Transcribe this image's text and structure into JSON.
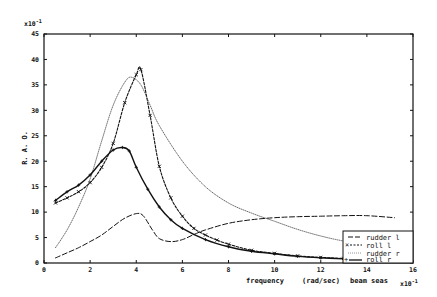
{
  "chart_data": {
    "type": "line",
    "title": "",
    "xlabel": "frequency   (rad/sec)   beam seas",
    "ylabel": "R. A. O.",
    "x_multiplier": "x10^-1",
    "y_multiplier": "x10^-1",
    "xlim": [
      0,
      16
    ],
    "ylim": [
      0,
      45
    ],
    "xticks": [
      0,
      2,
      4,
      6,
      8,
      10,
      12,
      14,
      16
    ],
    "yticks": [
      0,
      5,
      10,
      15,
      20,
      25,
      30,
      35,
      40,
      45
    ],
    "grid": false,
    "legend_position": "lower right",
    "series": [
      {
        "name": "rudder l",
        "style": "long-dash",
        "x": [
          0.5,
          1,
          1.5,
          2,
          2.5,
          3,
          3.5,
          4,
          4.3,
          4.7,
          5,
          5.5,
          6,
          6.5,
          7,
          8,
          9,
          10,
          11,
          12,
          13,
          14,
          15.2
        ],
        "y": [
          1.0,
          2.0,
          3.0,
          4.2,
          5.5,
          7.2,
          8.8,
          9.7,
          9.3,
          6.5,
          4.8,
          4.2,
          4.6,
          5.6,
          6.5,
          7.8,
          8.5,
          8.9,
          9.1,
          9.2,
          9.3,
          9.3,
          8.9
        ]
      },
      {
        "name": "roll l",
        "style": "short-dash with x markers",
        "x": [
          0.5,
          1,
          1.5,
          2,
          2.5,
          3,
          3.5,
          4,
          4.2,
          4.6,
          5,
          5.5,
          6,
          6.5,
          7,
          7.5,
          8,
          9,
          10,
          11,
          12,
          13
        ],
        "y": [
          11.8,
          12.8,
          14.0,
          15.8,
          18.8,
          23.5,
          31.5,
          37.0,
          38.0,
          29.0,
          19.0,
          12.8,
          9.2,
          6.8,
          5.5,
          4.5,
          3.7,
          2.5,
          1.9,
          1.4,
          1.1,
          0.9
        ]
      },
      {
        "name": "rudder r",
        "style": "dotted",
        "x": [
          0.5,
          1,
          1.5,
          2,
          2.5,
          3,
          3.5,
          3.8,
          4.2,
          4.6,
          5,
          6,
          7,
          8,
          9,
          10,
          11,
          12,
          13,
          14
        ],
        "y": [
          3.0,
          6.5,
          11.0,
          16.5,
          24.0,
          31.0,
          35.5,
          36.5,
          35.0,
          31.0,
          27.0,
          20.0,
          15.0,
          11.8,
          9.8,
          8.2,
          6.6,
          5.3,
          4.3,
          3.5
        ]
      },
      {
        "name": "roll r",
        "style": "solid with + markers",
        "x": [
          0.5,
          1,
          1.5,
          2,
          2.5,
          3,
          3.4,
          3.7,
          4,
          4.5,
          5,
          5.5,
          6,
          7,
          8,
          9,
          10,
          11,
          12,
          13
        ],
        "y": [
          12.3,
          14.0,
          15.3,
          17.3,
          20.0,
          22.2,
          22.7,
          22.0,
          18.8,
          14.5,
          11.0,
          8.5,
          6.8,
          4.6,
          3.2,
          2.3,
          1.8,
          1.3,
          1.0,
          0.8
        ]
      }
    ]
  },
  "axes": {
    "y_multiplier_label": "x10",
    "y_multiplier_exp": "-1",
    "x_multiplier_label": "x10",
    "x_multiplier_exp": "-1",
    "ylabel": "R. A. O.",
    "xlabel_parts": [
      "frequency",
      "(rad/sec)",
      "beam seas"
    ]
  },
  "legend": [
    {
      "label": "rudder l"
    },
    {
      "label": "roll l"
    },
    {
      "label": "rudder r"
    },
    {
      "label": "roll r"
    }
  ]
}
